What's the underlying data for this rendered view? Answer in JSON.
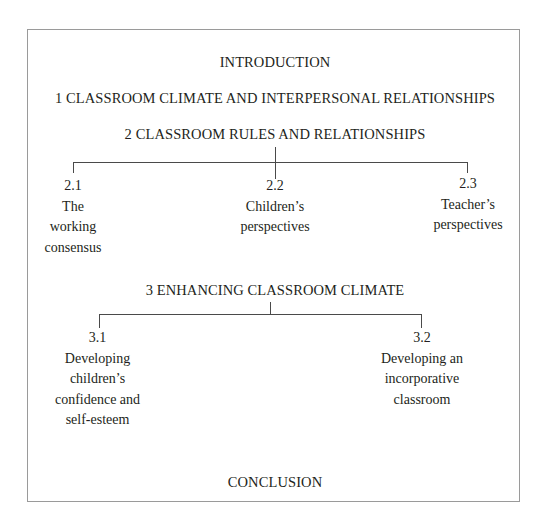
{
  "diagram": {
    "type": "chapter-structure-tree",
    "border_color": "#9a9a9a",
    "line_color": "#4a4a4a",
    "text_color": "#231f20",
    "introduction": "INTRODUCTION",
    "sections": [
      {
        "number": "1",
        "title": "1 CLASSROOM CLIMATE AND INTERPERSONAL RELATIONSHIPS",
        "subsections": []
      },
      {
        "number": "2",
        "title": "2 CLASSROOM RULES AND RELATIONSHIPS",
        "subsections": [
          {
            "number": "2.1",
            "lines": [
              "The",
              "working",
              "consensus"
            ]
          },
          {
            "number": "2.2",
            "lines": [
              "Children’s",
              "perspectives"
            ]
          },
          {
            "number": "2.3",
            "lines": [
              "Teacher’s",
              "perspectives"
            ]
          }
        ]
      },
      {
        "number": "3",
        "title": "3 ENHANCING CLASSROOM CLIMATE",
        "subsections": [
          {
            "number": "3.1",
            "lines": [
              "Developing",
              "children’s",
              "confidence and",
              "self-esteem"
            ]
          },
          {
            "number": "3.2",
            "lines": [
              "Developing an",
              "incorporative",
              "classroom"
            ]
          }
        ]
      }
    ],
    "conclusion": "CONCLUSION"
  }
}
